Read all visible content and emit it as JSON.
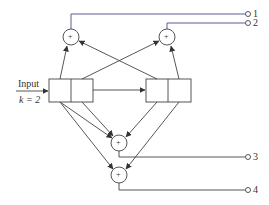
{
  "diagram": {
    "input_label": "Input",
    "k_label": "k = 2",
    "adder_symbol": "+",
    "outputs": [
      "1",
      "2",
      "3",
      "4"
    ],
    "line_color": "#444444",
    "accent_line_color": "#4a4a8a"
  }
}
